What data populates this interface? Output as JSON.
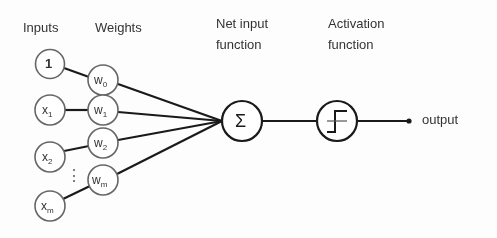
{
  "diagram": {
    "headers": {
      "inputs": "Inputs",
      "weights": "Weights",
      "net_input_line1": "Net input",
      "net_input_line2": "function",
      "activation_line1": "Activation",
      "activation_line2": "function"
    },
    "inputs": [
      {
        "label": "1",
        "sub": ""
      },
      {
        "label": "x",
        "sub": "1"
      },
      {
        "label": "x",
        "sub": "2"
      },
      {
        "label": "x",
        "sub": "m"
      }
    ],
    "weights": [
      {
        "label": "w",
        "sub": "0"
      },
      {
        "label": "w",
        "sub": "1"
      },
      {
        "label": "w",
        "sub": "2"
      },
      {
        "label": "w",
        "sub": "m"
      }
    ],
    "ellipsis": "⋮",
    "sum_symbol": "Σ",
    "activation_icon": "step-function-icon",
    "output_label": "output",
    "colors": {
      "stroke": "#1a1a1a",
      "node_stroke": "#555555",
      "text": "#333333"
    }
  }
}
